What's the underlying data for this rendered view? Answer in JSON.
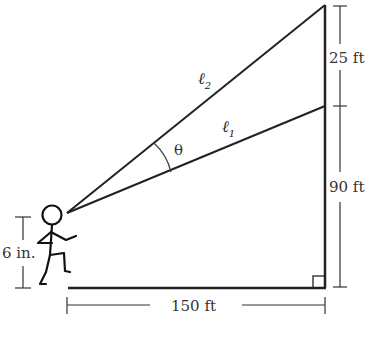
{
  "diagram": {
    "labels": {
      "line_upper": "ℓ",
      "line_upper_sub": "2",
      "line_lower": "ℓ",
      "line_lower_sub": "1",
      "angle": "θ",
      "top_segment": "25 ft",
      "lower_segment": "90 ft",
      "ground_distance": "150 ft",
      "eye_height": "6 in."
    },
    "elements": [
      "stick-figure",
      "building-wall",
      "ground-line",
      "right-angle-marker",
      "sight-line-1",
      "sight-line-2",
      "angle-arc"
    ]
  }
}
